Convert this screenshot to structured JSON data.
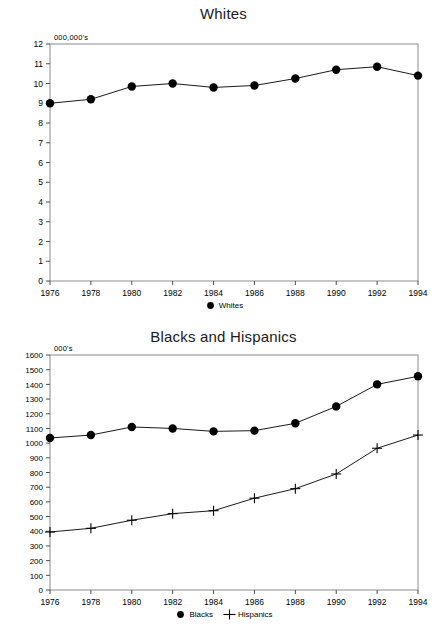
{
  "chart_data": [
    {
      "id": "whites",
      "type": "line",
      "title": "Whites",
      "xlabel": "",
      "ylabel": "",
      "unit_label": "000,000's",
      "x": [
        1976,
        1978,
        1980,
        1982,
        1984,
        1986,
        1988,
        1990,
        1992,
        1994
      ],
      "xtick_labels": [
        "1976",
        "1978",
        "1980",
        "1982",
        "1984",
        "1986",
        "1988",
        "1990",
        "1992",
        "1994"
      ],
      "xlim": [
        1976,
        1994
      ],
      "ylim": [
        0,
        12
      ],
      "ytick_values": [
        0,
        1,
        2,
        3,
        4,
        5,
        6,
        7,
        8,
        9,
        10,
        11,
        12
      ],
      "ytick_labels": [
        "0",
        "1",
        "2",
        "3",
        "4",
        "5",
        "6",
        "7",
        "8",
        "9",
        "10",
        "11",
        "12"
      ],
      "grid": false,
      "legend_position": "bottom-center",
      "series": [
        {
          "name": "Whites",
          "marker": "circle",
          "color": "#000000",
          "values": [
            9.0,
            9.2,
            9.85,
            10.0,
            9.8,
            9.9,
            10.25,
            10.7,
            10.85,
            10.4
          ]
        }
      ]
    },
    {
      "id": "blacks-and-hispanics",
      "type": "line",
      "title": "Blacks and Hispanics",
      "xlabel": "",
      "ylabel": "",
      "unit_label": "000's",
      "x": [
        1976,
        1978,
        1980,
        1982,
        1984,
        1986,
        1988,
        1990,
        1992,
        1994
      ],
      "xtick_labels": [
        "1976",
        "1978",
        "1980",
        "1982",
        "1984",
        "1986",
        "1988",
        "1990",
        "1992",
        "1994"
      ],
      "xlim": [
        1976,
        1994
      ],
      "ylim": [
        0,
        1600
      ],
      "ytick_values": [
        0,
        100,
        200,
        300,
        400,
        500,
        600,
        700,
        800,
        900,
        1000,
        1100,
        1200,
        1300,
        1400,
        1500,
        1600
      ],
      "ytick_labels": [
        "0",
        "100",
        "200",
        "300",
        "400",
        "500",
        "600",
        "700",
        "800",
        "900",
        "1000",
        "1100",
        "1200",
        "1300",
        "1400",
        "1500",
        "1600"
      ],
      "grid": false,
      "legend_position": "bottom-center",
      "series": [
        {
          "name": "Blacks",
          "marker": "circle",
          "color": "#000000",
          "values": [
            1035,
            1055,
            1110,
            1100,
            1080,
            1085,
            1135,
            1250,
            1400,
            1455
          ]
        },
        {
          "name": "Hispanics",
          "marker": "plus",
          "color": "#000000",
          "values": [
            395,
            420,
            475,
            520,
            540,
            625,
            690,
            790,
            965,
            1055
          ]
        }
      ]
    }
  ]
}
